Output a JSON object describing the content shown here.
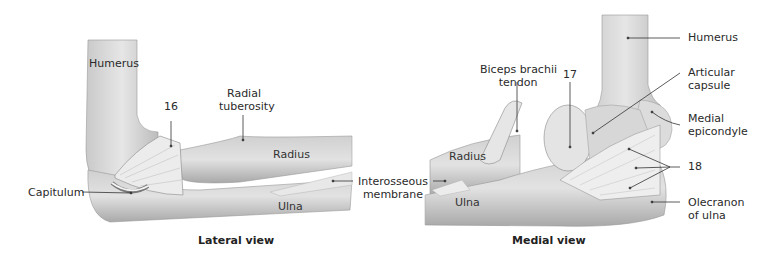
{
  "figure": {
    "lateral": {
      "caption": "Lateral view",
      "labels": {
        "humerus": "Humerus",
        "radial_tuberosity_l1": "Radial",
        "radial_tuberosity_l2": "tuberosity",
        "ligament_16": "16",
        "radius": "Radius",
        "capitulum": "Capitulum",
        "ulna": "Ulna",
        "interosseous_l1": "Interosseous",
        "interosseous_l2": "membrane"
      }
    },
    "medial": {
      "caption": "Medial view",
      "labels": {
        "humerus": "Humerus",
        "biceps_l1": "Biceps brachii",
        "biceps_l2": "tendon",
        "ligament_17": "17",
        "articular_l1": "Articular",
        "articular_l2": "capsule",
        "medial_epi_l1": "Medial",
        "medial_epi_l2": "epicondyle",
        "radius": "Radius",
        "ligament_18": "18",
        "ulna": "Ulna",
        "olecranon_l1": "Olecranon",
        "olecranon_l2": "of ulna"
      }
    }
  }
}
